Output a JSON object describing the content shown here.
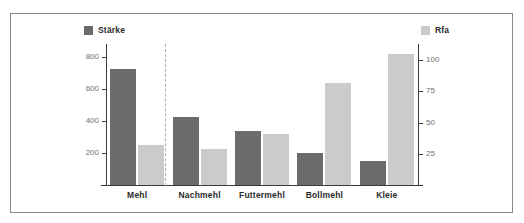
{
  "chart_data": {
    "type": "bar",
    "title": "",
    "subtitle": "",
    "xlabel": "",
    "ylabel": "",
    "grid": false,
    "legend_position": "top",
    "categories": [
      "Mehl",
      "Nachmehl",
      "Futtermehl",
      "Bollmehl",
      "Kleie"
    ],
    "series": [
      {
        "name": "Stärke",
        "axis": "left",
        "color": "#6b6b6b",
        "values": [
          725,
          425,
          335,
          200,
          150
        ]
      },
      {
        "name": "Rfa",
        "axis": "right",
        "color": "#cbcbcb",
        "values": [
          32,
          29,
          41,
          82,
          105
        ]
      }
    ],
    "left_axis": {
      "ticks": [
        200,
        400,
        600,
        800
      ],
      "ylim": [
        0,
        880
      ]
    },
    "right_axis": {
      "ticks": [
        25,
        50,
        75,
        100
      ],
      "ylim": [
        0,
        113
      ]
    },
    "annotations": [
      {
        "type": "vertical-dashed-line",
        "after_category": "Mehl"
      }
    ]
  },
  "legend": {
    "left": {
      "label": "Stärke",
      "swatch": "dark-square-marker"
    },
    "right": {
      "label": "Rfa",
      "swatch": "light-square-marker"
    }
  },
  "axes": {
    "left_tick_labels": [
      "200",
      "400",
      "600",
      "800"
    ],
    "right_tick_labels": [
      "25",
      "50",
      "75",
      "100"
    ]
  }
}
